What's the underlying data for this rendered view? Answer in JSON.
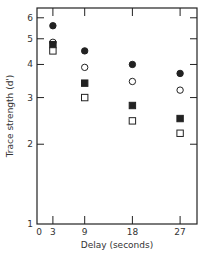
{
  "chart_data": {
    "type": "scatter",
    "title": "",
    "xlabel": "Delay (seconds)",
    "ylabel": "Trace strength (d')",
    "yscale": "log",
    "ylim": [
      1,
      6.5
    ],
    "xlim": [
      0,
      30
    ],
    "x": [
      3,
      9,
      18,
      27
    ],
    "x_ticks": [
      {
        "value": 0,
        "label": "0"
      },
      {
        "value": 3,
        "label": "3"
      },
      {
        "value": 9,
        "label": "9"
      },
      {
        "value": 18,
        "label": "18"
      },
      {
        "value": 27,
        "label": "27"
      }
    ],
    "y_ticks": [
      {
        "value": 1,
        "label": "1"
      },
      {
        "value": 2,
        "label": "2"
      },
      {
        "value": 3,
        "label": "3"
      },
      {
        "value": 4,
        "label": "4"
      },
      {
        "value": 5,
        "label": "5"
      },
      {
        "value": 6,
        "label": "6"
      }
    ],
    "grid": false,
    "legend": null,
    "series": [
      {
        "name": "filled-circle",
        "marker": "circle",
        "filled": true,
        "values": [
          5.6,
          4.5,
          4.0,
          3.7
        ]
      },
      {
        "name": "open-circle",
        "marker": "circle",
        "filled": false,
        "values": [
          4.85,
          3.9,
          3.45,
          3.2
        ]
      },
      {
        "name": "filled-square",
        "marker": "square",
        "filled": true,
        "values": [
          4.75,
          3.4,
          2.8,
          2.5
        ]
      },
      {
        "name": "open-square",
        "marker": "square",
        "filled": false,
        "values": [
          4.5,
          3.0,
          2.45,
          2.2
        ]
      }
    ]
  },
  "layout": {
    "plot": {
      "left": 37,
      "right": 197,
      "top": 8,
      "bottom": 224
    },
    "x_px_per_unit": 5.3,
    "y_px_per_decade": 265,
    "ink_color": "#222222"
  }
}
